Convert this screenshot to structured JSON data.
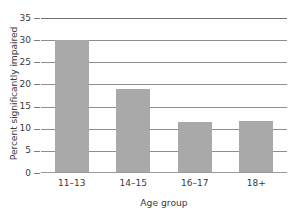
{
  "chart_data": {
    "type": "bar",
    "title": "",
    "subtitle": "",
    "xlabel": "Age group",
    "ylabel": "Percent significantly impaired",
    "categories": [
      "11–13",
      "14–15",
      "16–17",
      "18+"
    ],
    "values": [
      30.1,
      19.0,
      11.5,
      11.8
    ],
    "series": [
      {
        "name": "Percent significantly impaired",
        "values": [
          30.1,
          19.0,
          11.5,
          11.8
        ]
      }
    ],
    "ylim": [
      0,
      35
    ],
    "xlim": [
      0,
      4
    ],
    "yticks": [
      0,
      5,
      10,
      15,
      20,
      25,
      30,
      35
    ],
    "ytick_labels": [
      "0",
      "5",
      "10",
      "15",
      "20",
      "25",
      "30",
      "35"
    ],
    "grid": true,
    "grid_axis": "y",
    "legend": false,
    "legend_position": "none",
    "bar_color": "#a9a9a9",
    "grid_color": "#8e8e8e",
    "axis_color": "#7d7d7d",
    "text_color": "#3a3a3a",
    "background": "#ffffff",
    "annotations": []
  }
}
